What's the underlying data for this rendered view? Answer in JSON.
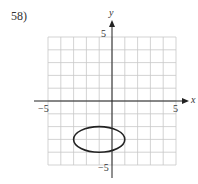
{
  "problem": {
    "number": "58)"
  },
  "chart_data": {
    "type": "line",
    "title": "",
    "xlabel": "x",
    "ylabel": "y",
    "xlim": [
      -5,
      5
    ],
    "ylim": [
      -5,
      5
    ],
    "grid": true,
    "tick_labels": {
      "x": [
        "-5",
        "5"
      ],
      "y": [
        "5",
        "-5"
      ]
    },
    "shapes": [
      {
        "kind": "ellipse",
        "center": [
          -1,
          -3
        ],
        "rx": 2,
        "ry": 1
      }
    ]
  },
  "axis_labels": {
    "x": "x",
    "y": "y",
    "xmin": "−5",
    "xmax": "5",
    "ymax": "5",
    "ymin": "−5"
  }
}
